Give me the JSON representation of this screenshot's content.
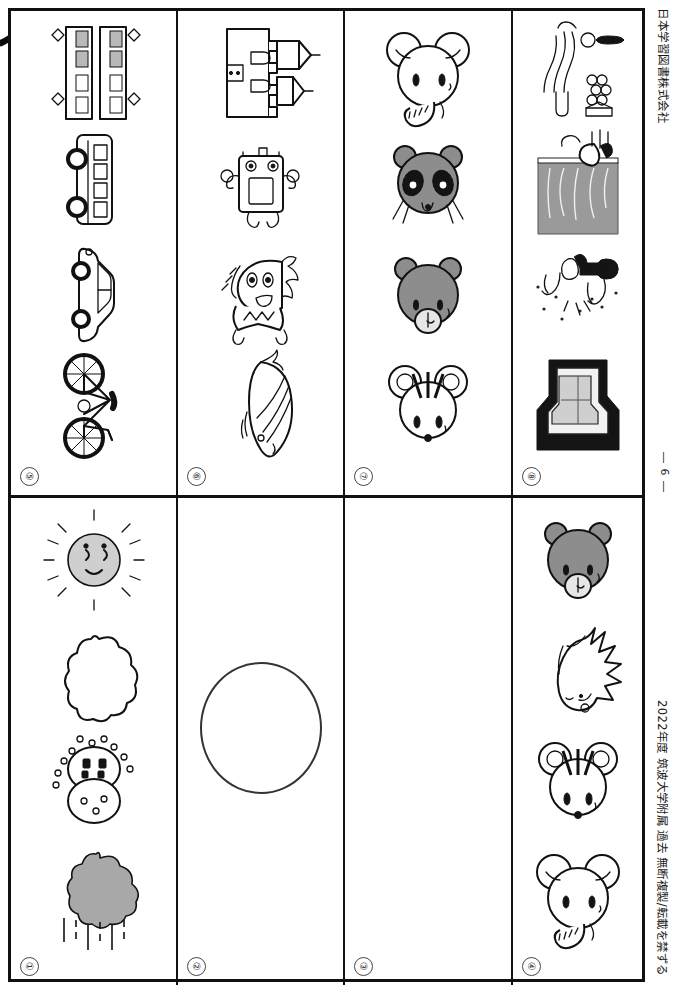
{
  "page": {
    "publisher": "日本学習図書株式会社",
    "page_number": "― 6 ―",
    "copyright_line": "2022年度 筑波大学附属 過去 無断複製/転載を禁ずる",
    "bleed_mark": "ノ"
  },
  "sections": [
    {
      "id": "5",
      "index_label": "⑤",
      "items": [
        {
          "name": "train-picture",
          "label": "train"
        },
        {
          "name": "bus-picture",
          "label": "bus"
        },
        {
          "name": "car-picture",
          "label": "car"
        },
        {
          "name": "bicycle-picture",
          "label": "bicycle"
        }
      ]
    },
    {
      "id": "6",
      "index_label": "⑥",
      "items": [
        {
          "name": "castle-picture",
          "label": "castle"
        },
        {
          "name": "robot-toy-picture",
          "label": "robot toy"
        },
        {
          "name": "ogre-picture",
          "label": "ogre figure"
        },
        {
          "name": "whale-picture",
          "label": "whale"
        }
      ]
    },
    {
      "id": "7",
      "index_label": "⑦",
      "items": [
        {
          "name": "elephant-picture",
          "label": "elephant"
        },
        {
          "name": "panda-picture",
          "label": "panda"
        },
        {
          "name": "bear-picture",
          "label": "bear"
        },
        {
          "name": "mouse-picture",
          "label": "mouse"
        }
      ]
    },
    {
      "id": "8",
      "index_label": "⑧",
      "items": [
        {
          "name": "spring-plants-picture",
          "label": "spring plants"
        },
        {
          "name": "summer-scene-picture",
          "label": "summer scene"
        },
        {
          "name": "snow-play-picture",
          "label": "winter snow play"
        },
        {
          "name": "roof-building-picture",
          "label": "building roof"
        }
      ]
    },
    {
      "id": "1",
      "index_label": "①",
      "items": [
        {
          "name": "sun-picture",
          "label": "sun"
        },
        {
          "name": "cloud-picture",
          "label": "cloud"
        },
        {
          "name": "snow-cloud-picture",
          "label": "snow cloud"
        },
        {
          "name": "rain-cloud-picture",
          "label": "rain cloud"
        }
      ]
    },
    {
      "id": "2",
      "index_label": "②",
      "items": [
        {
          "name": "answer-circle",
          "label": "empty circle"
        }
      ]
    },
    {
      "id": "3",
      "index_label": "③",
      "items": []
    },
    {
      "id": "4",
      "index_label": "④",
      "items": [
        {
          "name": "bear-picture",
          "label": "bear"
        },
        {
          "name": "hedgehog-picture",
          "label": "hedgehog"
        },
        {
          "name": "mouse-picture",
          "label": "mouse"
        },
        {
          "name": "elephant-picture",
          "label": "elephant"
        }
      ]
    }
  ]
}
